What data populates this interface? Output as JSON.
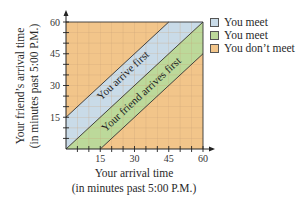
{
  "chart_data": {
    "type": "area",
    "title": "",
    "xlabel_lines": [
      "Your arrival time",
      "(in minutes past 5:00 P.M.)"
    ],
    "ylabel_lines": [
      "Your friend’s arrival time",
      "(in minutes past 5:00 P.M.)"
    ],
    "xlim": [
      0,
      60
    ],
    "ylim": [
      0,
      60
    ],
    "x_ticks": [
      15,
      30,
      45,
      60
    ],
    "y_ticks": [
      15,
      30,
      45,
      60
    ],
    "x_tick_labels": [
      "15",
      "30",
      "45",
      "60"
    ],
    "y_tick_labels": [
      "15",
      "30",
      "45",
      "60"
    ],
    "minor_tick_step": 5,
    "grid": true,
    "regions": [
      {
        "name": "You don't meet",
        "description": "entire square outside bands",
        "color": "#f2c58a"
      },
      {
        "name": "You arrive first",
        "condition": "0 <= y - x <= 15",
        "color": "#c9dbe8",
        "label": "You arrive first"
      },
      {
        "name": "Your friend arrives first",
        "condition": "0 <= x - y <= 15",
        "color": "#bcd99a",
        "label": "Your friend arrives first"
      }
    ],
    "boundary_lines": [
      {
        "from": [
          0,
          15
        ],
        "to": [
          45,
          60
        ]
      },
      {
        "from": [
          0,
          0
        ],
        "to": [
          60,
          60
        ]
      },
      {
        "from": [
          15,
          0
        ],
        "to": [
          60,
          45
        ]
      }
    ]
  },
  "legend": {
    "placement": "right",
    "items": [
      {
        "label": "You meet",
        "color": "#c9dbe8"
      },
      {
        "label": "You meet",
        "color": "#bcd99a"
      },
      {
        "label": "You don’t meet",
        "color": "#f2c58a"
      }
    ]
  }
}
